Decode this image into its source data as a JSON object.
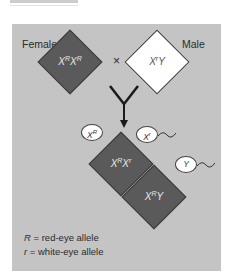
{
  "cross": {
    "female_label": "Female",
    "male_label": "Male",
    "cross_symbol": "×",
    "female_genotype": {
      "base1": "X",
      "sup1": "R",
      "base2": "X",
      "sup2": "R"
    },
    "male_genotype": {
      "base1": "X",
      "sup1": "r",
      "base2": "Y"
    }
  },
  "gametes": {
    "egg": {
      "base": "X",
      "sup": "R"
    },
    "sperm1": {
      "base": "X",
      "sup": "r"
    },
    "sperm2": {
      "base": "Y"
    }
  },
  "offspring": [
    {
      "base1": "X",
      "sup1": "R",
      "base2": "X",
      "sup2": "r"
    },
    {
      "base1": "X",
      "sup1": "R",
      "base2": "Y"
    }
  ],
  "legend": [
    {
      "symbol": "R",
      "text": "= red-eye allele"
    },
    {
      "symbol": "r",
      "text": " = white-eye allele"
    }
  ],
  "colors": {
    "dark_square": "#5a5a5a",
    "white_square": "#ffffff",
    "background": "#c4c4c4"
  }
}
